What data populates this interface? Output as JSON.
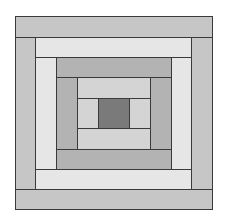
{
  "diagram": {
    "type": "log-cabin-quilt-block",
    "colors": {
      "center": "#7a7a7a",
      "ring1": "#d4d4d4",
      "ring2": "#b3b3b3",
      "ring3": "#e6e6e6",
      "ring4": "#c6c6c6",
      "outline": "#3a3a3a"
    },
    "center": {
      "name": "center-square",
      "color_key": "center"
    },
    "rings": [
      {
        "name": "ring-1",
        "color_key": "ring1",
        "strips": [
          "top",
          "left",
          "right",
          "bottom"
        ]
      },
      {
        "name": "ring-2",
        "color_key": "ring2",
        "strips": [
          "top",
          "left",
          "right",
          "bottom"
        ]
      },
      {
        "name": "ring-3",
        "color_key": "ring3",
        "strips": [
          "top",
          "left",
          "right",
          "bottom"
        ]
      },
      {
        "name": "ring-4",
        "color_key": "ring4",
        "strips": [
          "top",
          "left",
          "right",
          "bottom"
        ]
      }
    ]
  }
}
